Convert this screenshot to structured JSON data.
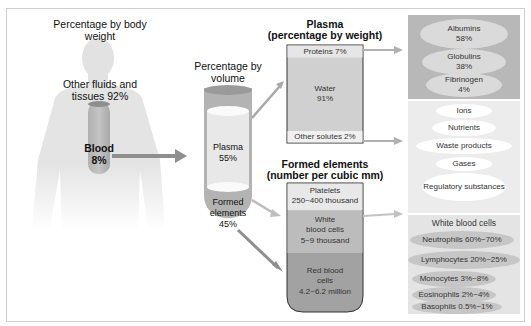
{
  "body_section": {
    "title": "Percentage by body weight",
    "other_label": "Other fluids and tissues 92%",
    "blood_label": "Blood",
    "blood_value": "8%"
  },
  "volume_section": {
    "title": "Percentage by volume",
    "plasma_label": "Plasma",
    "plasma_value": "55%",
    "formed_label": "Formed elements",
    "formed_value": "45%"
  },
  "plasma_section": {
    "title": "Plasma",
    "subtitle": "(percentage by weight)",
    "proteins": "Proteins 7%",
    "water_label": "Water",
    "water_value": "91%",
    "other_solutes": "Other solutes 2%"
  },
  "formed_section": {
    "title": "Formed elements",
    "subtitle": "(number per cubic mm)",
    "platelets_label": "Platelets",
    "platelets_value": "250~400 thousand",
    "wbc_label": "White blood cells",
    "wbc_value": "5~9 thousand",
    "rbc_label": "Red blood cells",
    "rbc_value": "4.2~6.2 million"
  },
  "proteins_panel": [
    {
      "label": "Albumins",
      "value": "58%"
    },
    {
      "label": "Globulins",
      "value": "38%"
    },
    {
      "label": "Fibrinogen",
      "value": "4%"
    }
  ],
  "solutes_panel": [
    "Ions",
    "Nutrients",
    "Waste products",
    "Gases",
    "Regulatory substances"
  ],
  "wbc_panel": {
    "title": "White blood cells",
    "items": [
      "Neutrophils 60%~70%",
      "Lymphocytes 20%~25%",
      "Monocytes 3%~8%",
      "Eosinophils 2%~4%",
      "Basophils 0.5%~1%"
    ]
  },
  "colors": {
    "silhouette": "#e6e6e6",
    "tube_formed": "#a9a9a9",
    "plasma_light": "#e2e2e2",
    "arrow": "#9a9a9a",
    "panel_dark": "#b8b8b8"
  }
}
